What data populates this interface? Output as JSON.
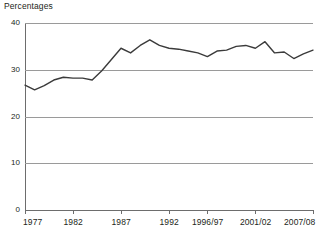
{
  "chart_data": {
    "type": "line",
    "title": "Percentages",
    "xlabel": "",
    "ylabel": "",
    "ylim": [
      0,
      40
    ],
    "yticks": [
      0,
      10,
      20,
      30,
      40
    ],
    "ytick_labels": [
      "0",
      "10",
      "20",
      "30",
      "40"
    ],
    "grid": true,
    "grid_axis": "y",
    "legend": false,
    "legend_position": "none",
    "line_color": "#3b3b3b",
    "grid_color": "#9a9a9a",
    "axis_color": "#6d6d6d",
    "text_color": "#231f20",
    "background": "#ffffff",
    "xtick_labels": [
      "1977",
      "1982",
      "1987",
      "1992",
      "1996/97",
      "2001/02",
      "2007/08"
    ],
    "xtick_positions": [
      0,
      5,
      10,
      15,
      19,
      24,
      30
    ],
    "categories": [
      "1977",
      "1978",
      "1979",
      "1980",
      "1981",
      "1982",
      "1983",
      "1984",
      "1985",
      "1986",
      "1987",
      "1988",
      "1989",
      "1990",
      "1991",
      "1992",
      "1993",
      "1994",
      "1995",
      "1996/97",
      "1997/98",
      "1998/99",
      "1999/00",
      "2000/01",
      "2001/02",
      "2002/03",
      "2003/04",
      "2004/05",
      "2005/06",
      "2006/07",
      "2007/08"
    ],
    "values": [
      26.7,
      25.7,
      26.6,
      27.8,
      28.4,
      28.2,
      28.2,
      27.8,
      29.8,
      32.2,
      34.6,
      33.6,
      35.2,
      36.4,
      35.2,
      34.6,
      34.4,
      34.0,
      33.6,
      32.8,
      34.0,
      34.2,
      35.0,
      35.2,
      34.6,
      36.0,
      33.6,
      33.8,
      32.4,
      33.4,
      34.2
    ],
    "series": [
      {
        "name": "Percentages",
        "values": [
          26.7,
          25.7,
          26.6,
          27.8,
          28.4,
          28.2,
          28.2,
          27.8,
          29.8,
          32.2,
          34.6,
          33.6,
          35.2,
          36.4,
          35.2,
          34.6,
          34.4,
          34.0,
          33.6,
          32.8,
          34.0,
          34.2,
          35.0,
          35.2,
          34.6,
          36.0,
          33.6,
          33.8,
          32.4,
          33.4,
          34.2
        ]
      }
    ]
  }
}
